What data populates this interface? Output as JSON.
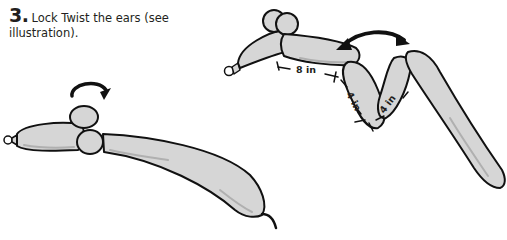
{
  "step": {
    "number": "3.",
    "text": "Lock Twist the ears (see illustration)."
  },
  "illustration": {
    "balloon_fill": "#d6d6d6",
    "balloon_shadow": "#b0b0b0",
    "outline": "#111111",
    "measurements": {
      "first": "8 in",
      "second": "4 in",
      "third": "4 in"
    }
  }
}
